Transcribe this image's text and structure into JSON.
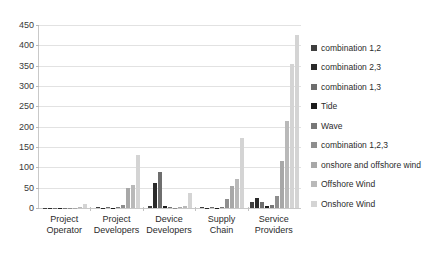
{
  "chart_data": {
    "type": "bar",
    "title": "",
    "xlabel": "",
    "ylabel": "",
    "ylim": [
      0,
      450
    ],
    "yticks": [
      450,
      400,
      350,
      300,
      250,
      200,
      150,
      100,
      50,
      0
    ],
    "grid": true,
    "legend_position": "right",
    "categories": [
      "Project Operator",
      "Project Developers",
      "Device Developers",
      "Supply Chain",
      "Service Providers"
    ],
    "category_lines": [
      [
        "Project",
        "Operator"
      ],
      [
        "Project",
        "Developers"
      ],
      [
        "Device",
        "Developers"
      ],
      [
        "Supply",
        "Chain"
      ],
      [
        "Service",
        "Providers"
      ]
    ],
    "series": [
      {
        "name": "combination 1,2",
        "color": "#3f3f3f",
        "values": [
          0,
          2,
          6,
          2,
          16
        ]
      },
      {
        "name": "combination 2,3",
        "color": "#2a2a2a",
        "values": [
          0,
          1,
          62,
          1,
          25
        ]
      },
      {
        "name": "combination 1,3",
        "color": "#6e6e6e",
        "values": [
          0,
          3,
          88,
          3,
          14
        ]
      },
      {
        "name": "Tide",
        "color": "#1c1c1c",
        "values": [
          0,
          0,
          4,
          1,
          5
        ]
      },
      {
        "name": "Wave",
        "color": "#777777",
        "values": [
          0,
          2,
          2,
          2,
          8
        ]
      },
      {
        "name": "combination 1,2,3",
        "color": "#8e8e8e",
        "values": [
          0,
          8,
          1,
          22,
          30
        ]
      },
      {
        "name": "onshore and offshore wind",
        "color": "#a8a8a8",
        "values": [
          1,
          48,
          3,
          55,
          115
        ]
      },
      {
        "name": "Offshore Wind",
        "color": "#b9b9b9",
        "values": [
          3,
          56,
          6,
          72,
          215
        ]
      },
      {
        "name": "Onshore Wind",
        "color": "#d4d4d4",
        "values": [
          9,
          130,
          36,
          172,
          355
        ]
      }
    ],
    "extra_tall_bar": {
      "series": "Onshore Wind",
      "category": "Service Providers",
      "value": 425
    }
  },
  "axis": {
    "y_max_label": "450",
    "y_min_label": "0"
  }
}
